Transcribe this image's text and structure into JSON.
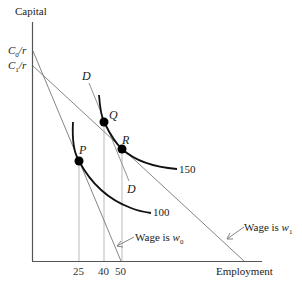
{
  "diagram": {
    "y_axis_label": "Capital",
    "x_axis_label": "Employment",
    "y_intercepts": [
      {
        "var": "C",
        "sub": "0",
        "rest": "/r"
      },
      {
        "var": "C",
        "sub": "1",
        "rest": "/r"
      }
    ],
    "x_ticks": [
      "25",
      "40",
      "50"
    ],
    "isoquants": [
      {
        "label": "100"
      },
      {
        "label": "150"
      }
    ],
    "points": {
      "P": "P",
      "Q": "Q",
      "R": "R"
    },
    "demand_line": {
      "top_label": "D",
      "bottom_label": "D"
    },
    "isocost_lines": [
      {
        "prefix": "Wage is ",
        "var": "w",
        "sub": "0"
      },
      {
        "prefix": "Wage is ",
        "var": "w",
        "sub": "1"
      }
    ],
    "colors": {
      "axis": "#555555",
      "isocost": "#777777",
      "curve": "#111111",
      "dot": "#000000",
      "guide": "#aaaaaa"
    }
  }
}
